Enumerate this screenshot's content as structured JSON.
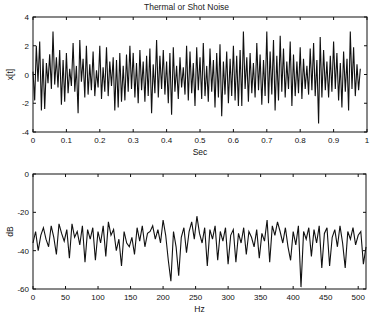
{
  "chart_data": [
    {
      "type": "line",
      "title": "Thermal or Shot Noise",
      "xlabel": "Sec",
      "ylabel": "x[t]",
      "xlim": [
        0,
        1
      ],
      "ylim": [
        -4,
        4
      ],
      "xticks": [
        "0",
        "0.1",
        "0.2",
        "0.3",
        "0.4",
        "0.5",
        "0.6",
        "0.7",
        "0.8",
        "0.9",
        "1"
      ],
      "yticks": [
        "4",
        "2",
        "0",
        "-2",
        "-4"
      ],
      "grid": false,
      "description": "Gaussian white noise, 1024 samples over 1 s, amplitude mostly within ±2.5, peaks near 3.0 and -3.4",
      "x": [
        0,
        0.005,
        0.01,
        0.015,
        0.02,
        0.025,
        0.03,
        0.035,
        0.04,
        0.045,
        0.05,
        0.055,
        0.06,
        0.065,
        0.07,
        0.075,
        0.08,
        0.085,
        0.09,
        0.095,
        0.1,
        0.105,
        0.11,
        0.115,
        0.12,
        0.125,
        0.13,
        0.135,
        0.14,
        0.145,
        0.15,
        0.155,
        0.16,
        0.165,
        0.17,
        0.175,
        0.18,
        0.185,
        0.19,
        0.195,
        0.2,
        0.205,
        0.21,
        0.215,
        0.22,
        0.225,
        0.23,
        0.235,
        0.24,
        0.245,
        0.25,
        0.255,
        0.26,
        0.265,
        0.27,
        0.275,
        0.28,
        0.285,
        0.29,
        0.295,
        0.3,
        0.305,
        0.31,
        0.315,
        0.32,
        0.325,
        0.33,
        0.335,
        0.34,
        0.345,
        0.35,
        0.355,
        0.36,
        0.365,
        0.37,
        0.375,
        0.38,
        0.385,
        0.39,
        0.395,
        0.4,
        0.405,
        0.41,
        0.415,
        0.42,
        0.425,
        0.43,
        0.435,
        0.44,
        0.445,
        0.45,
        0.455,
        0.46,
        0.465,
        0.47,
        0.475,
        0.48,
        0.485,
        0.49,
        0.495,
        0.5,
        0.505,
        0.51,
        0.515,
        0.52,
        0.525,
        0.53,
        0.535,
        0.54,
        0.545,
        0.55,
        0.555,
        0.56,
        0.565,
        0.57,
        0.575,
        0.58,
        0.585,
        0.59,
        0.595,
        0.6,
        0.605,
        0.61,
        0.615,
        0.62,
        0.625,
        0.63,
        0.635,
        0.64,
        0.645,
        0.65,
        0.655,
        0.66,
        0.665,
        0.67,
        0.675,
        0.68,
        0.685,
        0.69,
        0.695,
        0.7,
        0.705,
        0.71,
        0.715,
        0.72,
        0.725,
        0.73,
        0.735,
        0.74,
        0.745,
        0.75,
        0.755,
        0.76,
        0.765,
        0.77,
        0.775,
        0.78,
        0.785,
        0.79,
        0.795,
        0.8,
        0.805,
        0.81,
        0.815,
        0.82,
        0.825,
        0.83,
        0.835,
        0.84,
        0.845,
        0.85,
        0.855,
        0.86,
        0.865,
        0.87,
        0.875,
        0.88,
        0.885,
        0.89,
        0.895,
        0.9,
        0.905,
        0.91,
        0.915,
        0.92,
        0.925,
        0.93,
        0.935,
        0.94,
        0.945,
        0.95,
        0.955,
        0.96,
        0.965,
        0.97,
        0.975,
        0.98,
        0.985,
        0.99,
        0.995,
        1
      ],
      "values": [
        0.2,
        -1.8,
        2.0,
        -0.5,
        2.3,
        -2.5,
        1.1,
        -2.4,
        0.8,
        -0.6,
        1.4,
        -1.0,
        3.0,
        -0.7,
        1.2,
        -0.9,
        1.7,
        -2.1,
        1.0,
        -1.9,
        1.5,
        -1.3,
        0.4,
        -0.8,
        2.2,
        -1.2,
        0.6,
        -2.7,
        2.4,
        -0.5,
        1.1,
        -1.6,
        2.0,
        -1.4,
        0.7,
        -1.1,
        1.6,
        -1.5,
        0.3,
        -0.9,
        2.0,
        -1.7,
        0.5,
        -1.2,
        1.9,
        -1.5,
        0.9,
        -0.8,
        1.2,
        -2.5,
        1.0,
        -2.3,
        1.5,
        -1.9,
        0.6,
        -1.8,
        1.4,
        -1.2,
        2.0,
        -1.0,
        1.5,
        -1.6,
        0.8,
        -2.0,
        1.7,
        -1.1,
        0.9,
        -1.9,
        1.3,
        -1.5,
        1.8,
        -2.7,
        0.7,
        -1.3,
        2.4,
        -1.6,
        1.3,
        -1.0,
        1.7,
        -1.4,
        0.9,
        -2.0,
        1.5,
        -2.8,
        1.9,
        -1.2,
        0.6,
        -1.7,
        1.2,
        -0.9,
        0.5,
        -1.4,
        2.0,
        -1.8,
        1.6,
        -1.3,
        0.8,
        -2.2,
        1.9,
        -1.1,
        1.2,
        -1.7,
        2.2,
        -1.5,
        0.6,
        -1.9,
        1.8,
        -1.2,
        1.0,
        -2.3,
        1.5,
        -1.6,
        2.1,
        -2.9,
        0.9,
        -1.4,
        1.6,
        -2.0,
        1.1,
        -1.5,
        2.0,
        -1.8,
        1.3,
        -2.2,
        1.7,
        -2.2,
        3.0,
        -1.0,
        1.2,
        -1.9,
        1.5,
        -1.3,
        0.8,
        -1.6,
        2.2,
        -1.1,
        1.4,
        -2.1,
        1.0,
        -1.5,
        3.0,
        -2.0,
        1.6,
        -1.4,
        2.4,
        -2.5,
        1.3,
        -1.8,
        2.7,
        -1.2,
        1.8,
        -1.6,
        0.9,
        -1.0,
        2.3,
        -2.2,
        1.4,
        -1.5,
        0.9,
        -1.3,
        1.9,
        -1.7,
        1.1,
        -1.0,
        0.6,
        -1.4,
        1.8,
        -1.1,
        2.2,
        -1.5,
        1.0,
        -3.4,
        2.6,
        -1.6,
        1.7,
        -1.1,
        0.9,
        -1.6,
        1.3,
        -1.2,
        2.3,
        -1.0,
        1.5,
        -1.8,
        0.8,
        -2.3,
        1.6,
        -1.2,
        1.1,
        -2.5,
        3.0,
        -1.0,
        1.9,
        -1.5,
        0.7,
        -1.1,
        0.4
      ]
    },
    {
      "type": "line",
      "title": "",
      "xlabel": "Hz",
      "ylabel": "dB",
      "xlim": [
        0,
        512
      ],
      "ylim": [
        -60,
        0
      ],
      "xticks": [
        "0",
        "50",
        "100",
        "150",
        "200",
        "250",
        "300",
        "350",
        "400",
        "450",
        "500"
      ],
      "yticks": [
        "0",
        "-20",
        "-40",
        "-60"
      ],
      "grid": false,
      "description": "Power spectrum of white noise: flat around -30 to -35 dB, dips to about -56 dB near 210 Hz and -59 dB near 412 Hz, peaks near -22 dB",
      "x": [
        0,
        4,
        8,
        12,
        16,
        20,
        24,
        28,
        32,
        36,
        40,
        44,
        48,
        52,
        56,
        60,
        64,
        68,
        72,
        76,
        80,
        84,
        88,
        92,
        96,
        100,
        104,
        108,
        112,
        116,
        120,
        124,
        128,
        132,
        136,
        140,
        144,
        148,
        152,
        156,
        160,
        164,
        168,
        172,
        176,
        180,
        184,
        188,
        192,
        196,
        200,
        204,
        208,
        212,
        216,
        220,
        224,
        228,
        232,
        236,
        240,
        244,
        248,
        252,
        256,
        260,
        264,
        268,
        272,
        276,
        280,
        284,
        288,
        292,
        296,
        300,
        304,
        308,
        312,
        316,
        320,
        324,
        328,
        332,
        336,
        340,
        344,
        348,
        352,
        356,
        360,
        364,
        368,
        372,
        376,
        380,
        384,
        388,
        392,
        396,
        400,
        404,
        408,
        412,
        416,
        420,
        424,
        428,
        432,
        436,
        440,
        444,
        448,
        452,
        456,
        460,
        464,
        468,
        472,
        476,
        480,
        484,
        488,
        492,
        496,
        500,
        504,
        508,
        512
      ],
      "values": [
        -36,
        -30,
        -40,
        -32,
        -28,
        -34,
        -38,
        -27,
        -33,
        -42,
        -26,
        -31,
        -35,
        -29,
        -44,
        -26,
        -33,
        -30,
        -37,
        -27,
        -46,
        -29,
        -34,
        -28,
        -45,
        -30,
        -36,
        -27,
        -43,
        -25,
        -32,
        -29,
        -40,
        -34,
        -48,
        -30,
        -36,
        -38,
        -33,
        -42,
        -28,
        -35,
        -27,
        -38,
        -31,
        -30,
        -27,
        -34,
        -29,
        -36,
        -24,
        -32,
        -45,
        -56,
        -30,
        -38,
        -53,
        -33,
        -28,
        -41,
        -30,
        -25,
        -34,
        -22,
        -31,
        -36,
        -28,
        -48,
        -29,
        -34,
        -27,
        -45,
        -30,
        -35,
        -28,
        -47,
        -32,
        -29,
        -46,
        -31,
        -36,
        -28,
        -42,
        -30,
        -33,
        -38,
        -29,
        -44,
        -31,
        -35,
        -24,
        -46,
        -27,
        -32,
        -25,
        -30,
        -36,
        -28,
        -38,
        -45,
        -30,
        -37,
        -27,
        -59,
        -30,
        -34,
        -28,
        -43,
        -29,
        -36,
        -27,
        -49,
        -31,
        -28,
        -48,
        -33,
        -29,
        -38,
        -27,
        -36,
        -49,
        -30,
        -34,
        -28,
        -37,
        -32,
        -30,
        -47,
        -38
      ]
    }
  ]
}
